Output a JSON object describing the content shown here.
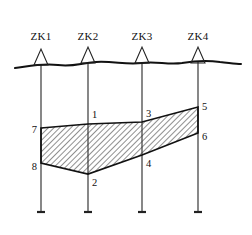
{
  "figure": {
    "kind": "geological-cross-section",
    "background_color": "#ffffff",
    "line_color": "#111111",
    "borehole_line_color": "#555555",
    "hatch_color": "#333333"
  },
  "boreholes": [
    {
      "id": "ZK1",
      "label": "ZK1",
      "x": 41,
      "label_x": 41,
      "label_y": 40,
      "top_y": 64,
      "bottom_y": 212
    },
    {
      "id": "ZK2",
      "label": "ZK2",
      "x": 88,
      "label_x": 88,
      "label_y": 40,
      "top_y": 62,
      "bottom_y": 212
    },
    {
      "id": "ZK3",
      "label": "ZK3",
      "x": 142,
      "label_x": 142,
      "label_y": 40,
      "top_y": 62,
      "bottom_y": 212
    },
    {
      "id": "ZK4",
      "label": "ZK4",
      "x": 198,
      "label_x": 198,
      "label_y": 40,
      "top_y": 62,
      "bottom_y": 212
    }
  ],
  "ground_surface": {
    "name": "ground-surface-line",
    "path": "M 15,68 C 30,66 42,63 58,65 C 74,67 80,63 96,62 C 114,61 126,65 142,63 C 156,61 168,65 182,63 C 194,61 206,60 220,62 C 230,63 236,64 241,64"
  },
  "layer": {
    "name": "hatched-soil-layer",
    "description": "Single hatched stratum correlated between ZK1 and ZK4",
    "top_boundary": [
      {
        "point": "7",
        "x": 41,
        "y": 128
      },
      {
        "point": "1",
        "x": 88,
        "y": 124
      },
      {
        "point": "3",
        "x": 142,
        "y": 122
      },
      {
        "point": "5",
        "x": 198,
        "y": 107
      }
    ],
    "bottom_boundary": [
      {
        "point": "8",
        "x": 41,
        "y": 163
      },
      {
        "point": "2",
        "x": 88,
        "y": 174
      },
      {
        "point": "4",
        "x": 142,
        "y": 155
      },
      {
        "point": "6",
        "x": 198,
        "y": 133
      }
    ],
    "polygon_points": "41,128 88,124 142,122 198,107 198,133 142,155 88,174 41,163"
  },
  "point_labels": [
    {
      "text": "1",
      "x": 92,
      "y": 118,
      "anchor": "start"
    },
    {
      "text": "2",
      "x": 92,
      "y": 186,
      "anchor": "start"
    },
    {
      "text": "3",
      "x": 146,
      "y": 117,
      "anchor": "start"
    },
    {
      "text": "4",
      "x": 146,
      "y": 167,
      "anchor": "start"
    },
    {
      "text": "5",
      "x": 202,
      "y": 110,
      "anchor": "start"
    },
    {
      "text": "6",
      "x": 202,
      "y": 140,
      "anchor": "start"
    },
    {
      "text": "7",
      "x": 37,
      "y": 133,
      "anchor": "end"
    },
    {
      "text": "8",
      "x": 37,
      "y": 170,
      "anchor": "end"
    }
  ]
}
